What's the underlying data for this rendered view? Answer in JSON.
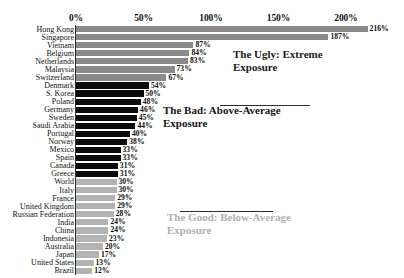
{
  "chart_data": {
    "type": "bar",
    "orientation": "horizontal",
    "title": "",
    "xlabel": "",
    "ylabel": "",
    "xlim": [
      0,
      230
    ],
    "grid": false,
    "legend": "none",
    "axis_ticks": [
      "0%",
      "50%",
      "100%",
      "150%",
      "200%"
    ],
    "axis_tick_values": [
      0,
      50,
      100,
      150,
      200
    ],
    "categories": [
      "Hong Kong",
      "Singapore",
      "Vietnam",
      "Belgium",
      "Netherlands",
      "Malaysia",
      "Switzerland",
      "Denmark",
      "S. Korea",
      "Poland",
      "Germany",
      "Sweden",
      "Saudi Arabia",
      "Portugal",
      "Norway",
      "Mexico",
      "Spain",
      "Canada",
      "Greece",
      "World",
      "Italy",
      "France",
      "United Kingdom",
      "Russian Federation",
      "India",
      "China",
      "Indonesia",
      "Australia",
      "Japan",
      "United States",
      "Brazil"
    ],
    "values": [
      216,
      187,
      87,
      84,
      83,
      73,
      67,
      54,
      50,
      48,
      46,
      45,
      44,
      40,
      38,
      33,
      33,
      31,
      31,
      30,
      30,
      29,
      29,
      28,
      24,
      24,
      23,
      20,
      17,
      13,
      12
    ],
    "value_labels": [
      "216%",
      "187%",
      "87%",
      "84%",
      "83%",
      "73%",
      "67%",
      "54%",
      "50%",
      "48%",
      "46%",
      "45%",
      "44%",
      "40%",
      "38%",
      "33%",
      "33%",
      "31%",
      "31%",
      "30%",
      "30%",
      "29%",
      "29%",
      "28%",
      "24%",
      "24%",
      "23%",
      "20%",
      "17%",
      "13%",
      "12%"
    ],
    "groups": [
      "ugly",
      "ugly",
      "ugly",
      "ugly",
      "ugly",
      "ugly",
      "ugly",
      "bad",
      "bad",
      "bad",
      "bad",
      "bad",
      "bad",
      "bad",
      "bad",
      "bad",
      "bad",
      "bad",
      "bad",
      "good",
      "good",
      "good",
      "good",
      "good",
      "good",
      "good",
      "good",
      "good",
      "good",
      "good",
      "good"
    ],
    "group_colors": {
      "ugly": "#8a8a8a",
      "bad": "#0b0b0b",
      "good": "#b3b3b3"
    },
    "annotations": [
      {
        "key": "ugly",
        "text": "The Ugly: Extreme\nExposure"
      },
      {
        "key": "bad",
        "text": "The Bad: Above-Average\nExposure"
      },
      {
        "key": "good",
        "text": "The Good: Below-Average\nExposure"
      }
    ]
  }
}
